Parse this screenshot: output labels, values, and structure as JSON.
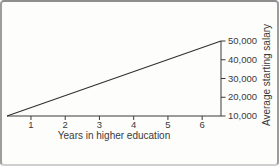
{
  "figure": {
    "background": "#fdfdfc",
    "frame_color": "#9d9d9d"
  },
  "chart_data": {
    "type": "line",
    "title": "",
    "xlabel": "Years in higher education",
    "ylabel": "Average starting salary",
    "xlim": [
      0.3,
      6.55
    ],
    "ylim": [
      10000,
      50000
    ],
    "x_ticks": [
      1,
      2,
      3,
      4,
      5,
      6
    ],
    "y_ticks": [
      10000,
      20000,
      30000,
      40000,
      50000
    ],
    "y_tick_labels": [
      "10,000",
      "20,000",
      "30,000",
      "40,000",
      "50,000"
    ],
    "grid": false,
    "legend": null,
    "axis_color": "#3a3a3a",
    "line_color": "#303030",
    "series": [
      {
        "name": "Average starting salary vs years in higher education",
        "x": [
          0.3,
          6.55
        ],
        "y": [
          10000,
          50000
        ]
      }
    ]
  }
}
